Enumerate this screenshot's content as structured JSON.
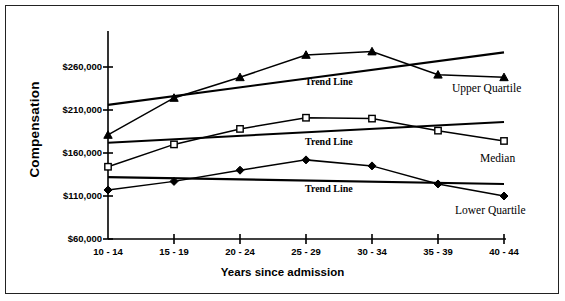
{
  "chart_data": {
    "type": "line",
    "title": "",
    "xlabel": "Years since admission",
    "ylabel": "Compensation",
    "categories": [
      "10 - 14",
      "15 - 19",
      "20 - 24",
      "25 - 29",
      "30 - 34",
      "35 - 39",
      "40 - 44"
    ],
    "ytick_labels": [
      "$60,000",
      "$110,000",
      "$160,000",
      "$210,000",
      "$260,000"
    ],
    "ytick_values": [
      60000,
      110000,
      160000,
      210000,
      260000
    ],
    "ylim": [
      60000,
      285000
    ],
    "grid": false,
    "legend_position": "inline-right-annotations",
    "series": [
      {
        "name": "Upper Quartile",
        "marker": "triangle",
        "values": [
          181000,
          224000,
          248000,
          274000,
          278000,
          251000,
          248000
        ]
      },
      {
        "name": "Median",
        "marker": "square",
        "values": [
          144000,
          170000,
          188000,
          201000,
          200000,
          186000,
          174000
        ]
      },
      {
        "name": "Lower Quartile",
        "marker": "diamond",
        "values": [
          117000,
          127000,
          140000,
          152000,
          145000,
          124000,
          110000
        ]
      }
    ],
    "trend_lines": [
      {
        "name": "Trend Line",
        "for_series": "Upper Quartile",
        "start_value": 216000,
        "end_value": 277000
      },
      {
        "name": "Trend Line",
        "for_series": "Median",
        "start_value": 172000,
        "end_value": 196000
      },
      {
        "name": "Trend Line",
        "for_series": "Lower Quartile",
        "start_value": 132000,
        "end_value": 124000
      }
    ],
    "annotations": [
      {
        "text": "Trend Line",
        "series": "Upper Quartile"
      },
      {
        "text": "Trend Line",
        "series": "Median"
      },
      {
        "text": "Trend Line",
        "series": "Lower Quartile"
      },
      {
        "text": "Upper Quartile",
        "series": "Upper Quartile"
      },
      {
        "text": "Median",
        "series": "Median"
      },
      {
        "text": "Lower Quartile",
        "series": "Lower Quartile"
      }
    ],
    "colors": {
      "line": "#000000",
      "axis": "#000000",
      "background": "#ffffff",
      "border": "#222222"
    }
  },
  "axis": {
    "y_title": "Compensation",
    "x_title": "Years since admission",
    "y_ticks": [
      "$260,000",
      "$210,000",
      "$160,000",
      "$110,000",
      "$60,000"
    ],
    "x_ticks": [
      "10 - 14",
      "15 - 19",
      "20 - 24",
      "25 - 29",
      "30 - 34",
      "35 - 39",
      "40 - 44"
    ]
  },
  "annotations": {
    "trend_upper": "Trend Line",
    "trend_median": "Trend Line",
    "trend_lower": "Trend Line",
    "label_upper": "Upper  Quartile",
    "label_median": "Median",
    "label_lower": "Lower  Quartile"
  }
}
